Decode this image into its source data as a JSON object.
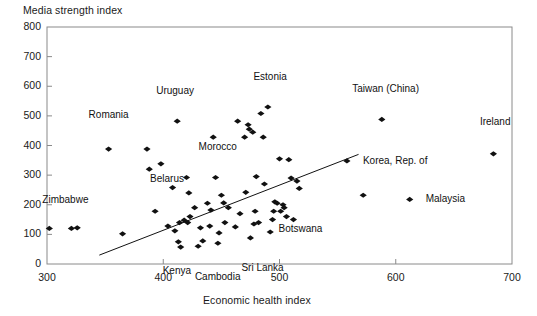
{
  "chart_data": {
    "type": "scatter",
    "title": "",
    "xlabel": "Economic health index",
    "ylabel": "Media strength index",
    "xlim": [
      300,
      700
    ],
    "ylim": [
      0,
      800
    ],
    "xticks": [
      300,
      400,
      500,
      600,
      700
    ],
    "yticks": [
      0,
      100,
      200,
      300,
      400,
      500,
      600,
      700,
      800
    ],
    "grid": false,
    "legend": null,
    "marker": "diamond",
    "marker_color": "#111111",
    "frame_color": "#8a8a8a",
    "trendline": {
      "x0": 345,
      "y0": 30,
      "x1": 568,
      "y1": 370
    },
    "points": [
      {
        "x": 302,
        "y": 120
      },
      {
        "x": 321,
        "y": 120
      },
      {
        "x": 326,
        "y": 122
      },
      {
        "x": 353,
        "y": 388
      },
      {
        "x": 365,
        "y": 102
      },
      {
        "x": 386,
        "y": 388
      },
      {
        "x": 388,
        "y": 320
      },
      {
        "x": 393,
        "y": 178
      },
      {
        "x": 398,
        "y": 338
      },
      {
        "x": 404,
        "y": 128
      },
      {
        "x": 408,
        "y": 258
      },
      {
        "x": 410,
        "y": 112
      },
      {
        "x": 412,
        "y": 482
      },
      {
        "x": 413,
        "y": 75
      },
      {
        "x": 414,
        "y": 140
      },
      {
        "x": 415,
        "y": 57
      },
      {
        "x": 418,
        "y": 148
      },
      {
        "x": 420,
        "y": 292
      },
      {
        "x": 421,
        "y": 140
      },
      {
        "x": 422,
        "y": 240
      },
      {
        "x": 423,
        "y": 160
      },
      {
        "x": 427,
        "y": 190
      },
      {
        "x": 430,
        "y": 60
      },
      {
        "x": 432,
        "y": 122
      },
      {
        "x": 434,
        "y": 78
      },
      {
        "x": 438,
        "y": 205
      },
      {
        "x": 440,
        "y": 128
      },
      {
        "x": 441,
        "y": 182
      },
      {
        "x": 443,
        "y": 428
      },
      {
        "x": 445,
        "y": 292
      },
      {
        "x": 447,
        "y": 70
      },
      {
        "x": 448,
        "y": 105
      },
      {
        "x": 450,
        "y": 232
      },
      {
        "x": 452,
        "y": 206
      },
      {
        "x": 453,
        "y": 140
      },
      {
        "x": 456,
        "y": 190
      },
      {
        "x": 462,
        "y": 125
      },
      {
        "x": 464,
        "y": 482
      },
      {
        "x": 466,
        "y": 170
      },
      {
        "x": 470,
        "y": 428
      },
      {
        "x": 471,
        "y": 242
      },
      {
        "x": 473,
        "y": 470
      },
      {
        "x": 474,
        "y": 455
      },
      {
        "x": 475,
        "y": 88
      },
      {
        "x": 477,
        "y": 445
      },
      {
        "x": 478,
        "y": 135
      },
      {
        "x": 479,
        "y": 178
      },
      {
        "x": 480,
        "y": 295
      },
      {
        "x": 482,
        "y": 140
      },
      {
        "x": 484,
        "y": 508
      },
      {
        "x": 486,
        "y": 428
      },
      {
        "x": 487,
        "y": 270
      },
      {
        "x": 490,
        "y": 530
      },
      {
        "x": 492,
        "y": 108
      },
      {
        "x": 494,
        "y": 150
      },
      {
        "x": 495,
        "y": 178
      },
      {
        "x": 496,
        "y": 210
      },
      {
        "x": 498,
        "y": 205
      },
      {
        "x": 500,
        "y": 355
      },
      {
        "x": 501,
        "y": 178
      },
      {
        "x": 503,
        "y": 200
      },
      {
        "x": 504,
        "y": 190
      },
      {
        "x": 506,
        "y": 160
      },
      {
        "x": 508,
        "y": 352
      },
      {
        "x": 510,
        "y": 290
      },
      {
        "x": 512,
        "y": 150
      },
      {
        "x": 515,
        "y": 280
      },
      {
        "x": 517,
        "y": 255
      },
      {
        "x": 558,
        "y": 348
      },
      {
        "x": 572,
        "y": 232
      },
      {
        "x": 588,
        "y": 488
      },
      {
        "x": 612,
        "y": 218
      },
      {
        "x": 684,
        "y": 372
      }
    ],
    "annotations": [
      {
        "label": "Uruguay",
        "point_x": 412,
        "point_y": 482,
        "dx": -2,
        "dy": 30
      },
      {
        "label": "Estonia",
        "point_x": 490,
        "point_y": 530,
        "dx": 2,
        "dy": 30
      },
      {
        "label": "Taiwan (China)",
        "point_x": 588,
        "point_y": 488,
        "dx": 4,
        "dy": 30
      },
      {
        "label": "Ireland",
        "point_x": 684,
        "point_y": 372,
        "dx": 2,
        "dy": 32
      },
      {
        "label": "Romania",
        "point_x": 353,
        "point_y": 388,
        "dx": 0,
        "dy": 34
      },
      {
        "label": "Morocco",
        "point_x": 445,
        "point_y": 292,
        "dx": 2,
        "dy": 30
      },
      {
        "label": "Korea, Rep. of",
        "point_x": 558,
        "point_y": 348,
        "dx": 16,
        "dy": 0
      },
      {
        "label": "Malaysia",
        "point_x": 612,
        "point_y": 218,
        "dx": 16,
        "dy": 0
      },
      {
        "label": "Belarus",
        "point_x": 393,
        "point_y": 178,
        "dx": 12,
        "dy": 32
      },
      {
        "label": "Zimbabwe",
        "point_x": 302,
        "point_y": 120,
        "dx": 16,
        "dy": 28
      },
      {
        "label": "Botswana",
        "point_x": 506,
        "point_y": 160,
        "dx": 14,
        "dy": -12
      },
      {
        "label": "Kenya",
        "point_x": 415,
        "point_y": 57,
        "dx": -4,
        "dy": -24
      },
      {
        "label": "Cambodia",
        "point_x": 447,
        "point_y": 70,
        "dx": 0,
        "dy": -34
      },
      {
        "label": "Sri Lanka",
        "point_x": 475,
        "point_y": 88,
        "dx": 12,
        "dy": -30
      }
    ]
  }
}
